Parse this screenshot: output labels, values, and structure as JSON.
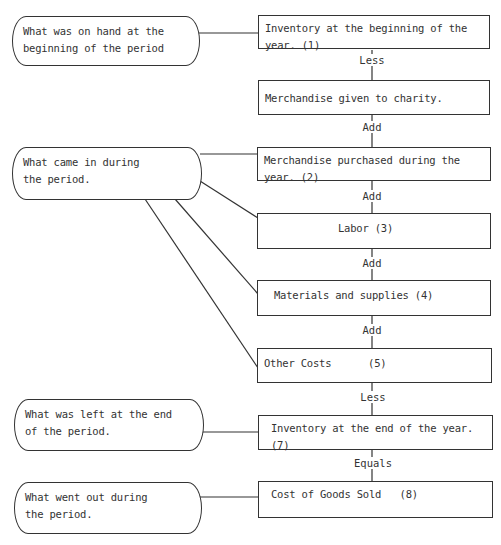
{
  "categories": [
    {
      "id": "on-hand",
      "text": "What was on hand at the beginning of the period"
    },
    {
      "id": "came-in",
      "text": "What came in during the period."
    },
    {
      "id": "left",
      "text": "What was left at the end of the period."
    },
    {
      "id": "went-out",
      "text": "What went out during the period."
    }
  ],
  "steps": [
    {
      "text": "Inventory at the beginning of the year.  (1)"
    },
    {
      "text": "Merchandise given to charity."
    },
    {
      "text": "Merchandise purchased during the year.  (2)"
    },
    {
      "text": "Labor (3)"
    },
    {
      "text": "Materials and supplies (4)"
    },
    {
      "text": "Other Costs      (5)"
    },
    {
      "text": "Inventory at the end of the year.  (7)"
    },
    {
      "text": "Cost of Goods Sold   (8)"
    }
  ],
  "operators": [
    "Less",
    "Add",
    "Add",
    "Add",
    "Add",
    "Less",
    "Equals"
  ]
}
